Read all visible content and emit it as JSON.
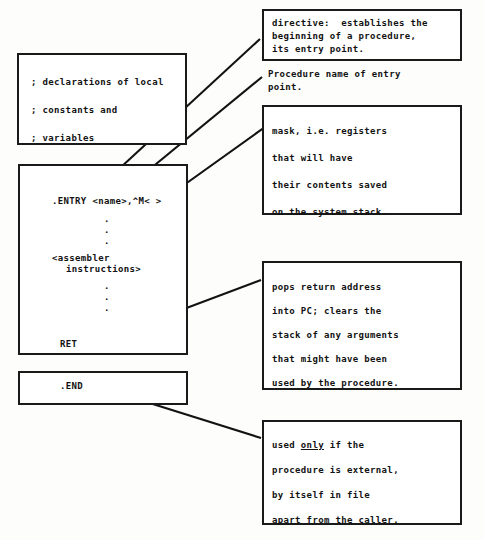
{
  "diagram": {
    "ink_color": "#121212",
    "background_color": "#fdfdfc"
  },
  "code_blocks": {
    "declarations": {
      "name": "declarations-block",
      "lines": [
        "; declarations of local",
        "; constants and",
        "; variables"
      ]
    },
    "procedure": {
      "name": "procedure-block",
      "entry_line": ".ENTRY <name>,^M< >",
      "dots_upper": [
        ".",
        ".",
        "."
      ],
      "instructions_line_1": "<assembler",
      "instructions_line_2": "instructions>",
      "dots_lower": [
        ".",
        ".",
        "."
      ],
      "ret_line": "RET"
    },
    "end": {
      "name": "end-block",
      "line": ".END"
    }
  },
  "annotations": {
    "directive": {
      "id": "note-directive",
      "boxed": true,
      "lines": [
        "directive:  establishes the",
        "beginning of a procedure,",
        "its entry point."
      ]
    },
    "procedure_name": {
      "id": "note-procedure-name",
      "boxed": false,
      "lines": [
        "Procedure name of entry",
        "point."
      ]
    },
    "mask": {
      "id": "note-mask",
      "boxed": true,
      "lines": [
        "mask, i.e. registers",
        "that will have",
        "their contents saved",
        "on the system stack."
      ]
    },
    "ret": {
      "id": "note-ret",
      "boxed": true,
      "lines": [
        "pops return address",
        "into PC; clears the",
        "stack of any arguments",
        "that might have been",
        "used by the procedure."
      ]
    },
    "end": {
      "id": "note-end",
      "boxed": true,
      "line1_pre": "used ",
      "line1_emphasis": "only",
      "line1_post": " if the",
      "lines_rest": [
        "procedure is external,",
        "by itself in file",
        "apart from the caller."
      ]
    }
  },
  "leader_lines": [
    {
      "name": "leader-entry-to-directive",
      "from": [
        94,
        192
      ],
      "to": [
        260,
        39
      ]
    },
    {
      "name": "leader-name-to-procname",
      "from": [
        122,
        192
      ],
      "to": [
        262,
        77
      ]
    },
    {
      "name": "leader-mask-to-maskbox",
      "from": [
        177,
        190
      ],
      "to": [
        265,
        127
      ]
    },
    {
      "name": "leader-ret-to-retbox",
      "from": [
        96,
        342
      ],
      "to": [
        261,
        280
      ]
    },
    {
      "name": "leader-end-to-endbox",
      "from": [
        89,
        384
      ],
      "to": [
        261,
        438
      ]
    }
  ]
}
